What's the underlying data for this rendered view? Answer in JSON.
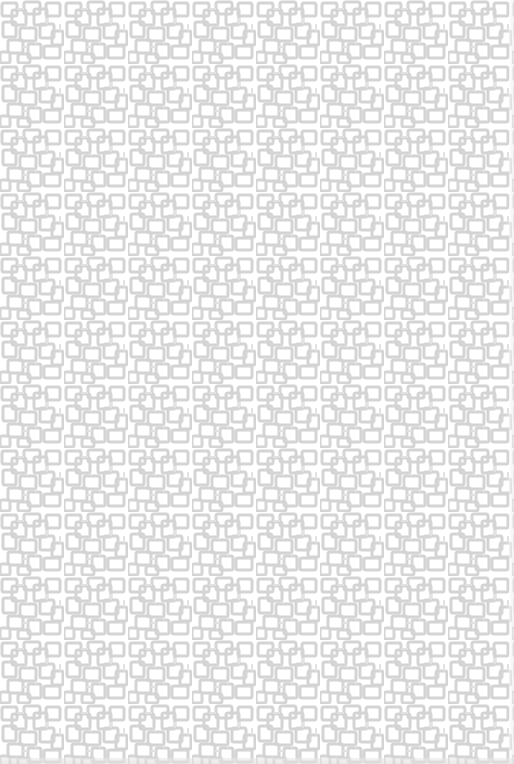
{
  "image": {
    "description": "Seamless geometric interlocking square outline pattern",
    "colors": {
      "background": "#ffffff",
      "stroke": "#d4d4d4",
      "stroke_light": "#e2e2e2"
    },
    "tile_size": 64,
    "stroke_width": 3
  }
}
